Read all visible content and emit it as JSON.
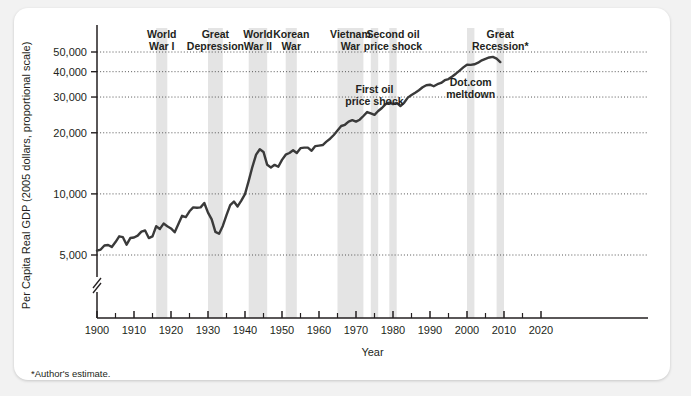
{
  "figure": {
    "footnote": "*Author's estimate.",
    "background_color": "#f2f2f2",
    "card_color": "#ffffff",
    "line_color": "#3a3a3a",
    "band_color": "#e4e4e4",
    "grid_color": "#555555",
    "axis_color": "#231f20"
  },
  "chart_data": {
    "type": "line",
    "title": "",
    "xlabel": "Year",
    "ylabel": "Per Capita Real GDP (2005 dollars, proportional scale)",
    "yscale": "log",
    "ylim": [
      4300,
      58000
    ],
    "xlim": [
      1898,
      2022
    ],
    "grid": true,
    "grid_axis": "y",
    "legend": "none",
    "axis_break": true,
    "ytick_values": [
      5000,
      10000,
      20000,
      30000,
      40000,
      50000
    ],
    "ytick_labels": [
      "5,000",
      "10,000",
      "20,000",
      "30,000",
      "40,000",
      "50,000"
    ],
    "xtick_major": [
      1900,
      1910,
      1920,
      1930,
      1940,
      1950,
      1960,
      1970,
      1980,
      1990,
      2000,
      2010,
      2020
    ],
    "xtick_labels": [
      "1900",
      "1910",
      "1920",
      "1930",
      "1940",
      "1950",
      "1960",
      "1970",
      "1980",
      "1990",
      "2000",
      "2010",
      "2020"
    ],
    "xtick_minor_step": 5,
    "x": [
      1900,
      1901,
      1902,
      1903,
      1904,
      1905,
      1906,
      1907,
      1908,
      1909,
      1910,
      1911,
      1912,
      1913,
      1914,
      1915,
      1916,
      1917,
      1918,
      1919,
      1920,
      1921,
      1922,
      1923,
      1924,
      1925,
      1926,
      1927,
      1928,
      1929,
      1930,
      1931,
      1932,
      1933,
      1934,
      1935,
      1936,
      1937,
      1938,
      1939,
      1940,
      1941,
      1942,
      1943,
      1944,
      1945,
      1946,
      1947,
      1948,
      1949,
      1950,
      1951,
      1952,
      1953,
      1954,
      1955,
      1956,
      1957,
      1958,
      1959,
      1960,
      1961,
      1962,
      1963,
      1964,
      1965,
      1966,
      1967,
      1968,
      1969,
      1970,
      1971,
      1972,
      1973,
      1974,
      1975,
      1976,
      1977,
      1978,
      1979,
      1980,
      1981,
      1982,
      1983,
      1984,
      1985,
      1986,
      1987,
      1988,
      1989,
      1990,
      1991,
      1992,
      1993,
      1994,
      1995,
      1996,
      1997,
      1998,
      1999,
      2000,
      2001,
      2002,
      2003,
      2004,
      2005,
      2006,
      2007,
      2008,
      2009
    ],
    "y": [
      5250,
      5320,
      5570,
      5600,
      5480,
      5790,
      6180,
      6120,
      5620,
      6060,
      6100,
      6230,
      6520,
      6600,
      6060,
      6180,
      6930,
      6720,
      7140,
      6930,
      6760,
      6470,
      7100,
      7800,
      7690,
      8210,
      8580,
      8540,
      8580,
      9020,
      8080,
      7490,
      6500,
      6360,
      6950,
      7850,
      8810,
      9170,
      8670,
      9270,
      9970,
      11600,
      13600,
      15600,
      16600,
      16100,
      13900,
      13500,
      13900,
      13600,
      14700,
      15600,
      15900,
      16400,
      15900,
      16800,
      16900,
      16900,
      16300,
      17200,
      17300,
      17400,
      18100,
      18700,
      19500,
      20500,
      21600,
      21900,
      22700,
      23100,
      22700,
      23200,
      24200,
      25300,
      24900,
      24500,
      25600,
      26500,
      27700,
      28200,
      27700,
      28100,
      27100,
      28100,
      29800,
      30700,
      31500,
      32400,
      33500,
      34300,
      34500,
      33900,
      34700,
      35200,
      36300,
      36800,
      37900,
      39100,
      40500,
      42000,
      43300,
      43200,
      43500,
      44300,
      45500,
      46300,
      47000,
      47300,
      46400,
      44600
    ],
    "shaded_bands": [
      {
        "label": "World\nWar I",
        "label_lines": [
          "World",
          "War I"
        ],
        "start": 1916,
        "end": 1919,
        "label_position": "top"
      },
      {
        "label": "Great\nDepression",
        "label_lines": [
          "Great",
          "Depression"
        ],
        "start": 1930,
        "end": 1934,
        "label_position": "top"
      },
      {
        "label": "World\nWar II",
        "label_lines": [
          "World",
          "War II"
        ],
        "start": 1941,
        "end": 1946,
        "label_position": "top"
      },
      {
        "label": "Korean\nWar",
        "label_lines": [
          "Korean",
          "War"
        ],
        "start": 1951,
        "end": 1954,
        "label_position": "top"
      },
      {
        "label": "Vietnam\nWar",
        "label_lines": [
          "Vietnam",
          "War"
        ],
        "start": 1965,
        "end": 1972,
        "label_position": "top"
      },
      {
        "label": "First oil\nprice shock",
        "label_lines": [
          "First oil",
          "price shock"
        ],
        "start": 1974,
        "end": 1976,
        "label_position": "inner"
      },
      {
        "label": "Second oil\nprice shock",
        "label_lines": [
          "Second oil",
          "price shock"
        ],
        "start": 1979,
        "end": 1981,
        "label_position": "top"
      },
      {
        "label": "Dot.com\nmeltdown",
        "label_lines": [
          "Dot.com",
          "meltdown"
        ],
        "start": 2000,
        "end": 2002,
        "label_position": "inner"
      },
      {
        "label": "Great\nRecession*",
        "label_lines": [
          "Great",
          "Recession*"
        ],
        "start": 2008,
        "end": 2010,
        "label_position": "top"
      }
    ]
  }
}
